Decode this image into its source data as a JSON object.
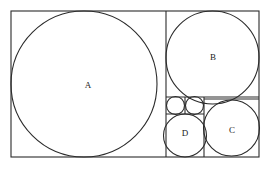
{
  "figure": {
    "background_color": "#ffffff",
    "stroke_color": "#2b2b2b",
    "label_color": "#1a1a1a",
    "outer_rect": {
      "x": 11,
      "y": 11,
      "width": 248,
      "height": 146
    },
    "squares": [
      {
        "name": "square-a",
        "x": 11,
        "y": 11,
        "size": 146
      },
      {
        "name": "square-b",
        "x": 166,
        "y": 11,
        "size": 93
      },
      {
        "name": "square-c",
        "x": 204,
        "y": 99,
        "size": 55
      },
      {
        "name": "square-d",
        "x": 166,
        "y": 114,
        "size": 43
      },
      {
        "name": "square-e",
        "x": 166,
        "y": 97,
        "size": 19
      },
      {
        "name": "square-f",
        "x": 185,
        "y": 97,
        "size": 19
      }
    ],
    "circles": [
      {
        "name": "circle-a",
        "cx": 84,
        "cy": 84,
        "r": 73,
        "label": "A"
      },
      {
        "name": "circle-b",
        "cx": 212.5,
        "cy": 57.5,
        "r": 46.5,
        "label": "B"
      },
      {
        "name": "circle-c",
        "cx": 231.5,
        "cy": 128,
        "r": 28,
        "label": "C"
      },
      {
        "name": "circle-d",
        "cx": 185,
        "cy": 135.5,
        "r": 21.5,
        "label": "D"
      },
      {
        "name": "circle-e",
        "cx": 175.5,
        "cy": 105.5,
        "r": 9,
        "label": ""
      },
      {
        "name": "circle-f",
        "cx": 194.5,
        "cy": 105.5,
        "r": 9,
        "label": ""
      }
    ],
    "labels": [
      {
        "name": "label-a",
        "text": "A",
        "x": 88,
        "y": 86
      },
      {
        "name": "label-b",
        "text": "B",
        "x": 213,
        "y": 58
      },
      {
        "name": "label-c",
        "text": "C",
        "x": 232,
        "y": 131
      },
      {
        "name": "label-d",
        "text": "D",
        "x": 185,
        "y": 134
      }
    ],
    "dividers": [
      {
        "name": "divider-vertical-main",
        "x1": 166,
        "y1": 11,
        "x2": 166,
        "y2": 157
      },
      {
        "name": "divider-horizontal-b",
        "x1": 166,
        "y1": 97,
        "x2": 259,
        "y2": 97
      },
      {
        "name": "divider-vertical-cd",
        "x1": 204,
        "y1": 97,
        "x2": 204,
        "y2": 157
      },
      {
        "name": "divider-horizontal-small",
        "x1": 166,
        "y1": 114,
        "x2": 204,
        "y2": 114
      },
      {
        "name": "divider-vertical-small",
        "x1": 185,
        "y1": 97,
        "x2": 185,
        "y2": 114
      },
      {
        "name": "divider-horizontal-c",
        "x1": 204,
        "y1": 99,
        "x2": 259,
        "y2": 99
      }
    ]
  }
}
